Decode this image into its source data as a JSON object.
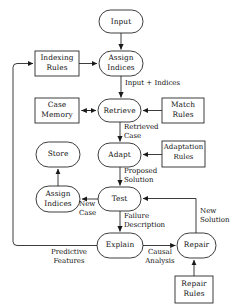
{
  "diagram": {
    "type": "flowchart",
    "stroke_color": "#1a1a1a",
    "background_color": "#ffffff",
    "nodes": [
      {
        "id": "input",
        "label": "Input",
        "shape": "rounded",
        "x": 99,
        "y": 10,
        "w": 44,
        "h": 23
      },
      {
        "id": "indexing-rules",
        "label": "Indexing\nRules",
        "shape": "rect",
        "x": 35,
        "y": 51,
        "w": 44,
        "h": 25
      },
      {
        "id": "assign-indices-top",
        "label": "Assign\nIndices",
        "shape": "rounded",
        "x": 99,
        "y": 51,
        "w": 44,
        "h": 25
      },
      {
        "id": "case-memory",
        "label": "Case\nMemory",
        "shape": "rect",
        "x": 35,
        "y": 98,
        "w": 44,
        "h": 25
      },
      {
        "id": "retrieve",
        "label": "Retrieve",
        "shape": "rounded",
        "x": 98,
        "y": 99,
        "w": 43,
        "h": 23
      },
      {
        "id": "match-rules",
        "label": "Match\nRules",
        "shape": "rect",
        "x": 162,
        "y": 98,
        "w": 42,
        "h": 25
      },
      {
        "id": "store",
        "label": "Store",
        "shape": "rounded",
        "x": 36,
        "y": 142,
        "w": 44,
        "h": 25
      },
      {
        "id": "adapt",
        "label": "Adapt",
        "shape": "rounded",
        "x": 98,
        "y": 143,
        "w": 43,
        "h": 24
      },
      {
        "id": "adaptation-rules",
        "label": "Adaptation\nRules",
        "shape": "rect",
        "x": 162,
        "y": 141,
        "w": 43,
        "h": 26
      },
      {
        "id": "assign-indices-bot",
        "label": "Assign\nIndices",
        "shape": "rounded",
        "x": 36,
        "y": 186,
        "w": 44,
        "h": 26
      },
      {
        "id": "test",
        "label": "Test",
        "shape": "rounded",
        "x": 98,
        "y": 187,
        "w": 43,
        "h": 24
      },
      {
        "id": "explain",
        "label": "Explain",
        "shape": "rounded",
        "x": 97,
        "y": 233,
        "w": 46,
        "h": 25
      },
      {
        "id": "repair",
        "label": "Repair",
        "shape": "rounded",
        "x": 177,
        "y": 233,
        "w": 39,
        "h": 25
      },
      {
        "id": "repair-rules",
        "label": "Repair\nRules",
        "shape": "rect",
        "x": 175,
        "y": 276,
        "w": 38,
        "h": 27
      }
    ],
    "edge_labels": [
      {
        "id": "input-plus-indices",
        "text": "Input + Indices",
        "x": 125,
        "y": 79,
        "w": 70,
        "align": "left"
      },
      {
        "id": "retrieved-case",
        "text": "Retrieved\nCase",
        "x": 124,
        "y": 123,
        "w": 48,
        "align": "left"
      },
      {
        "id": "proposed-solution",
        "text": "Proposed\nSolution",
        "x": 124,
        "y": 167,
        "w": 48,
        "align": "left"
      },
      {
        "id": "new-case",
        "text": "New\nCase",
        "x": 79,
        "y": 197,
        "w": 22,
        "align": "left"
      },
      {
        "id": "failure-description",
        "text": "Failure\nDescription",
        "x": 124,
        "y": 212,
        "w": 52,
        "align": "left"
      },
      {
        "id": "new-solution",
        "text": "New\nSolution",
        "x": 200,
        "y": 206,
        "w": 38,
        "align": "left"
      },
      {
        "id": "predictive-features",
        "text": "Predictive\nFeatures",
        "x": 42,
        "y": 246,
        "w": 54,
        "align": "center"
      },
      {
        "id": "causal-analysis",
        "text": "Causal\nAnalysis",
        "x": 143,
        "y": 246,
        "w": 34,
        "align": "center"
      }
    ],
    "edges": [
      {
        "from": "input",
        "to": "assign-indices-top",
        "label": ""
      },
      {
        "from": "indexing-rules",
        "to": "assign-indices-top",
        "label": ""
      },
      {
        "from": "assign-indices-top",
        "to": "retrieve",
        "label": "Input + Indices"
      },
      {
        "from": "case-memory",
        "to": "retrieve",
        "label": ""
      },
      {
        "from": "match-rules",
        "to": "retrieve",
        "label": ""
      },
      {
        "from": "retrieve",
        "to": "adapt",
        "label": "Retrieved Case"
      },
      {
        "from": "adaptation-rules",
        "to": "adapt",
        "label": ""
      },
      {
        "from": "adapt",
        "to": "test",
        "label": "Proposed Solution"
      },
      {
        "from": "test",
        "to": "assign-indices-bot",
        "label": "New Case"
      },
      {
        "from": "assign-indices-bot",
        "to": "store",
        "label": ""
      },
      {
        "from": "test",
        "to": "explain",
        "label": "Failure Description"
      },
      {
        "from": "explain",
        "to": "repair",
        "label": "Causal Analysis"
      },
      {
        "from": "repair",
        "to": "test",
        "label": "New Solution"
      },
      {
        "from": "repair-rules",
        "to": "repair",
        "label": ""
      },
      {
        "from": "explain",
        "to": "indexing-rules",
        "label": "Predictive Features"
      }
    ]
  }
}
